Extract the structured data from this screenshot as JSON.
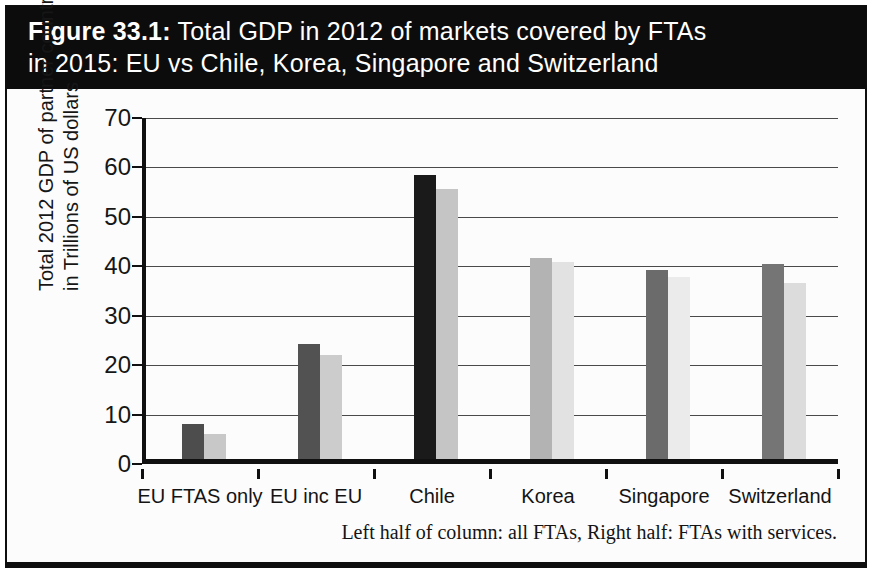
{
  "figure_title": {
    "prefix": "Figure 33.1:",
    "line1_rest": " Total GDP in 2012 of markets covered by FTAs",
    "line2": "in 2015: EU vs Chile, Korea, Singapore and Switzerland"
  },
  "colors": {
    "title_bar_bg": "#0c0c0c",
    "title_text": "#ffffff",
    "axis": "#101010",
    "gridline": "#4a4a4a"
  },
  "chart_data": {
    "type": "bar",
    "title": "Figure 33.1: Total GDP in 2012 of markets covered by FTAs in 2015: EU vs Chile, Korea, Singapore and Switzerland",
    "ylabel_line1": "Total 2012 GDP of partner countries",
    "ylabel_line2": "in Trillions of US dollars",
    "xlabel": "",
    "ylim": [
      0,
      70
    ],
    "yticks": [
      0,
      10,
      20,
      30,
      40,
      50,
      60,
      70
    ],
    "grid": true,
    "legend_position": "none",
    "categories": [
      "EU FTAS only",
      "EU inc EU",
      "Chile",
      "Korea",
      "Singapore",
      "Switzerland"
    ],
    "series": [
      {
        "name": "all FTAs",
        "values": [
          7.2,
          23.7,
          58.3,
          41.2,
          38.8,
          40.0
        ],
        "colors": [
          "#4d4d4d",
          "#525252",
          "#1a1a1a",
          "#b3b3b3",
          "#6b6b6b",
          "#757575"
        ]
      },
      {
        "name": "FTAs with services",
        "values": [
          5.1,
          21.4,
          55.4,
          40.5,
          37.3,
          36.2
        ],
        "colors": [
          "#c8c8c8",
          "#cccccc",
          "#c5c5c5",
          "#e2e2e2",
          "#ebebeb",
          "#dcdcdc"
        ]
      }
    ],
    "caption": "Left half of column: all FTAs, Right half: FTAs with services."
  }
}
